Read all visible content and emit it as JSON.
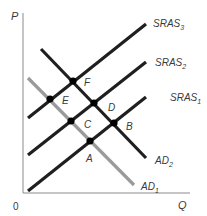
{
  "diagram": {
    "type": "aggregate-supply-demand",
    "axes": {
      "y_label": "P",
      "x_label": "Q",
      "origin_label": "0"
    },
    "curves": [
      {
        "id": "SRAS3",
        "base": "SRAS",
        "sub": "3",
        "color": "#1f1f1f",
        "x1": 28,
        "y1": 118,
        "x2": 146,
        "y2": 24,
        "lx": 153,
        "ly": 27
      },
      {
        "id": "SRAS2",
        "base": "SRAS",
        "sub": "2",
        "color": "#1f1f1f",
        "x1": 28,
        "y1": 155,
        "x2": 146,
        "y2": 62,
        "lx": 155,
        "ly": 66
      },
      {
        "id": "SRAS1",
        "base": "SRAS",
        "sub": "1",
        "color": "#1f1f1f",
        "x1": 28,
        "y1": 191,
        "x2": 146,
        "y2": 97,
        "lx": 170,
        "ly": 101
      },
      {
        "id": "AD2",
        "base": "AD",
        "sub": "2",
        "color": "#1f1f1f",
        "x1": 41,
        "y1": 49,
        "x2": 146,
        "y2": 158,
        "lx": 155,
        "ly": 164
      },
      {
        "id": "AD1",
        "base": "AD",
        "sub": "1",
        "color": "#9a9a9a",
        "x1": 28,
        "y1": 78,
        "x2": 134,
        "y2": 185,
        "lx": 141,
        "ly": 190
      }
    ],
    "points": [
      {
        "label": "A",
        "x": 90,
        "y": 141,
        "lx": 86,
        "ly": 162
      },
      {
        "label": "B",
        "x": 114,
        "y": 123,
        "lx": 126,
        "ly": 130
      },
      {
        "label": "C",
        "x": 71,
        "y": 121,
        "lx": 84,
        "ly": 128
      },
      {
        "label": "D",
        "x": 94,
        "y": 103,
        "lx": 108,
        "ly": 111
      },
      {
        "label": "E",
        "x": 50,
        "y": 99,
        "lx": 62,
        "ly": 104
      },
      {
        "label": "F",
        "x": 73,
        "y": 81,
        "lx": 84,
        "ly": 86
      }
    ]
  }
}
